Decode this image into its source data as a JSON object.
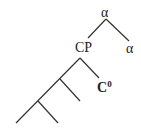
{
  "tree": {
    "root_label": "α",
    "left_child_label": "CP",
    "right_child_label": "α",
    "head_label": "C",
    "head_superscript": "0",
    "unlabeled_branch_levels": 2
  }
}
